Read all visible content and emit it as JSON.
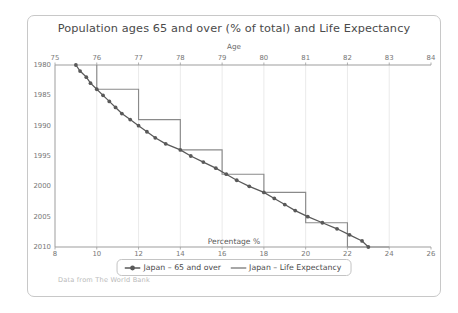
{
  "chart_data": {
    "type": "line",
    "title": "Population ages 65 and over (% of total) and Life Expectancy",
    "top_axis": {
      "label": "Age",
      "ticks": [
        75,
        76,
        77,
        78,
        79,
        80,
        81,
        82,
        83,
        84
      ],
      "range": [
        75,
        84
      ]
    },
    "bottom_axis": {
      "label": "Percentage %",
      "ticks": [
        8,
        10,
        12,
        14,
        16,
        18,
        20,
        22,
        24,
        26
      ],
      "range": [
        8,
        26
      ]
    },
    "left_axis": {
      "label": "",
      "ticks": [
        1980,
        1985,
        1990,
        1995,
        2000,
        2005,
        2010
      ],
      "range": [
        1980,
        2010
      ]
    },
    "grid": "vertical-only",
    "legend_position": "bottom",
    "years": [
      1980,
      1981,
      1982,
      1983,
      1984,
      1985,
      1986,
      1987,
      1988,
      1989,
      1990,
      1991,
      1992,
      1993,
      1994,
      1995,
      1996,
      1997,
      1998,
      1999,
      2000,
      2001,
      2002,
      2003,
      2004,
      2005,
      2006,
      2007,
      2008,
      2009,
      2010
    ],
    "series": [
      {
        "name": "Japan – 65 and over",
        "axis": "bottom",
        "unit": "%",
        "color": "#595959",
        "marker": "circle",
        "values": [
          9.0,
          9.2,
          9.5,
          9.7,
          10.0,
          10.3,
          10.6,
          10.9,
          11.2,
          11.6,
          12.0,
          12.4,
          12.8,
          13.3,
          14.0,
          14.5,
          15.1,
          15.7,
          16.2,
          16.7,
          17.3,
          18.0,
          18.5,
          19.0,
          19.5,
          20.1,
          20.8,
          21.5,
          22.1,
          22.7,
          23.0
        ]
      },
      {
        "name": "Japan – Life Expectancy",
        "axis": "top",
        "unit": "years",
        "color": "#8a8a8a",
        "marker": "none",
        "step": true,
        "values": [
          76.0,
          76.0,
          76.0,
          76.0,
          77.0,
          77.0,
          77.0,
          77.0,
          77.0,
          78.0,
          78.0,
          78.0,
          78.0,
          78.0,
          79.0,
          79.0,
          79.0,
          79.0,
          80.0,
          80.0,
          80.0,
          81.0,
          81.0,
          81.0,
          81.0,
          81.0,
          82.0,
          82.0,
          82.0,
          82.0,
          83.0
        ]
      }
    ]
  },
  "footer": {
    "note": "Data from The World Bank"
  },
  "legend": {
    "entries": [
      {
        "label": "Japan – 65 and over",
        "style": "line-with-marker"
      },
      {
        "label": "Japan – Life Expectancy",
        "style": "line"
      }
    ]
  }
}
